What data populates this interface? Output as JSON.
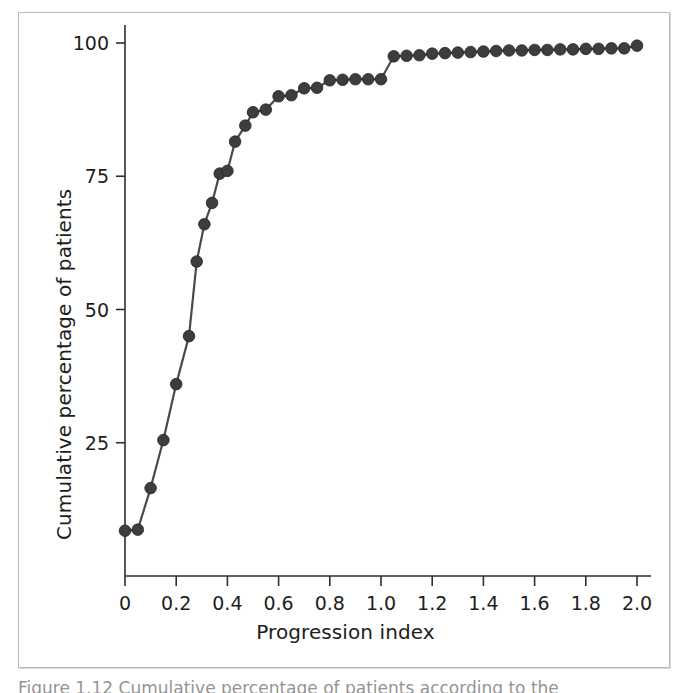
{
  "figure": {
    "frame_color": "#b9b9b9",
    "background": "#ffffff",
    "caption_partial": "Figure 1.12  Cumulative percentage of patients according to the"
  },
  "chart_data": {
    "type": "line",
    "title": "",
    "subtitle": "",
    "xlabel": "Progression index",
    "ylabel": "Cumulative percentage of patients",
    "xlim": [
      0,
      2.0
    ],
    "ylim": [
      0,
      100
    ],
    "xticks": [
      0,
      0.2,
      0.4,
      0.6,
      0.8,
      1.0,
      1.2,
      1.4,
      1.6,
      1.8,
      2.0
    ],
    "xticklabels": [
      "0",
      "0.2",
      "0.4",
      "0.6",
      "0.8",
      "1.0",
      "1.2",
      "1.4",
      "1.6",
      "1.8",
      "2.0"
    ],
    "yticks": [
      25,
      50,
      75,
      100
    ],
    "yticklabels": [
      "25",
      "50",
      "75",
      "100"
    ],
    "grid": false,
    "legend": null,
    "marker": "circle",
    "marker_color": "#3d3d3d",
    "line_color": "#4a4a4a",
    "series": [
      {
        "name": "Cumulative percentage of patients",
        "x": [
          0.0,
          0.05,
          0.1,
          0.15,
          0.2,
          0.25,
          0.28,
          0.31,
          0.34,
          0.37,
          0.4,
          0.43,
          0.47,
          0.5,
          0.55,
          0.6,
          0.65,
          0.7,
          0.75,
          0.8,
          0.85,
          0.9,
          0.95,
          1.0,
          1.05,
          1.1,
          1.15,
          1.2,
          1.25,
          1.3,
          1.35,
          1.4,
          1.45,
          1.5,
          1.55,
          1.6,
          1.65,
          1.7,
          1.75,
          1.8,
          1.85,
          1.9,
          1.95,
          2.0
        ],
        "y": [
          8.5,
          8.7,
          16.5,
          25.5,
          36.0,
          45.0,
          59.0,
          66.0,
          70.0,
          75.5,
          76.0,
          81.5,
          84.5,
          87.0,
          87.5,
          90.0,
          90.2,
          91.5,
          91.6,
          93.0,
          93.1,
          93.2,
          93.2,
          93.2,
          97.5,
          97.6,
          97.7,
          98.0,
          98.1,
          98.2,
          98.3,
          98.4,
          98.5,
          98.6,
          98.6,
          98.7,
          98.7,
          98.8,
          98.8,
          98.9,
          98.9,
          99.0,
          99.0,
          99.5
        ]
      }
    ]
  }
}
